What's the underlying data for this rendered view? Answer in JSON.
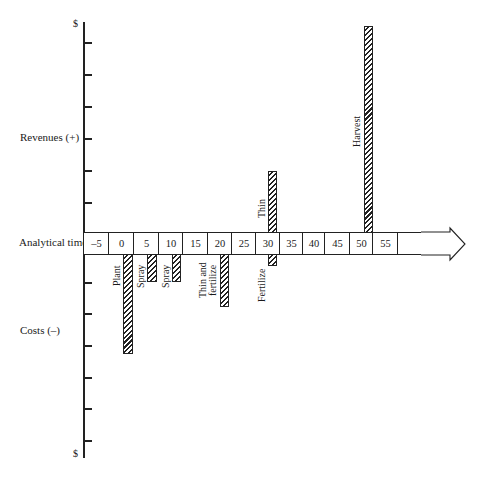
{
  "diagram": {
    "y_axis": {
      "top_label": "$",
      "bottom_label": "$",
      "revenues_label": "Revenues (+)",
      "costs_label": "Costs (–)"
    },
    "time_axis": {
      "label": "Analytical time",
      "ticks": [
        "–5",
        "0",
        "5",
        "10",
        "15",
        "20",
        "25",
        "30",
        "35",
        "40",
        "45",
        "50",
        "55",
        ""
      ]
    },
    "events": [
      {
        "label": "Plant",
        "time": 0,
        "type": "cost",
        "relative_magnitude": 3.1
      },
      {
        "label": "Spray",
        "time": 5,
        "type": "cost",
        "relative_magnitude": 0.9
      },
      {
        "label": "Spray",
        "time": 10,
        "type": "cost",
        "relative_magnitude": 0.9
      },
      {
        "label": "Thin and fertilize",
        "time": 20,
        "type": "cost",
        "relative_magnitude": 1.7
      },
      {
        "label": "Fertilize",
        "time": 30,
        "type": "cost",
        "relative_magnitude": 0.4
      },
      {
        "label": "Thin",
        "time": 30,
        "type": "revenue",
        "relative_magnitude": 2.0
      },
      {
        "label": "Harvest",
        "time": 50,
        "type": "revenue",
        "relative_magnitude": 6.4
      }
    ],
    "labels": {
      "plant": "Plant",
      "spray1": "Spray",
      "spray2": "Spray",
      "thin_fert_line1": "Thin and",
      "thin_fert_line2": "fertilize",
      "fertilize": "Fertilize",
      "thin": "Thin",
      "harvest": "Harvest"
    }
  }
}
